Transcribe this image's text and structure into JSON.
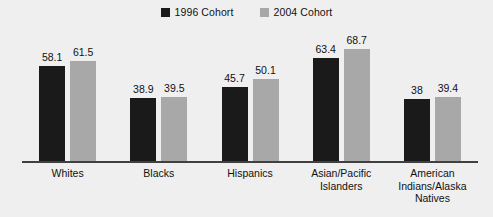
{
  "chart_data": {
    "type": "bar",
    "title": "",
    "subtitle": "",
    "xlabel": "",
    "ylabel": "",
    "ylim": [
      0,
      75
    ],
    "grid": false,
    "legend_position": "top-center",
    "categories": [
      "Whites",
      "Blacks",
      "Hispanics",
      "Asian/Pacific Islanders",
      "American Indians/Alaska Natives"
    ],
    "category_lines": [
      [
        "Whites"
      ],
      [
        "Blacks"
      ],
      [
        "Hispanics"
      ],
      [
        "Asian/Pacific",
        "Islanders"
      ],
      [
        "American",
        "Indians/Alaska",
        "Natives"
      ]
    ],
    "series": [
      {
        "name": "1996 Cohort",
        "color": "#1a1a1a",
        "values": [
          58.1,
          38.9,
          45.7,
          63.4,
          38
        ],
        "value_labels": [
          "58.1",
          "38.9",
          "45.7",
          "63.4",
          "38"
        ]
      },
      {
        "name": "2004 Cohort",
        "color": "#a8a8a8",
        "values": [
          61.5,
          39.5,
          50.1,
          68.7,
          39.4
        ],
        "value_labels": [
          "61.5",
          "39.5",
          "50.1",
          "68.7",
          "39.4"
        ]
      }
    ]
  },
  "legend": {
    "items": [
      {
        "label": "1996 Cohort",
        "color": "#1a1a1a"
      },
      {
        "label": "2004 Cohort",
        "color": "#a8a8a8"
      }
    ]
  },
  "colors": {
    "background": "#efefef",
    "axis": "#404040",
    "text": "#111111",
    "series_1996": "#1a1a1a",
    "series_2004": "#a8a8a8"
  }
}
